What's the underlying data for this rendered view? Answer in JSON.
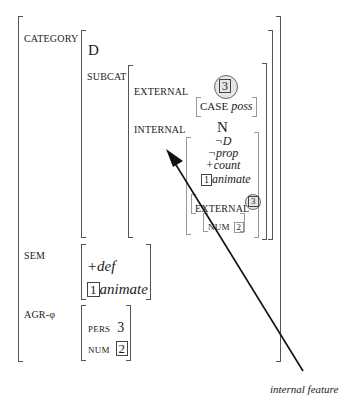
{
  "avm": {
    "category": {
      "label": "CATEGORY",
      "value": "D",
      "subcat": {
        "label": "SUBCAT",
        "external": {
          "label": "EXTERNAL",
          "tag": "3",
          "case_label": "CASE",
          "case_value": "poss"
        },
        "internal": {
          "label": "INTERNAL",
          "head": "N",
          "features": [
            "¬D",
            "¬prop",
            "+count"
          ],
          "animate_tag": "1",
          "animate": "animate",
          "external_label": "EXTERNAL",
          "external_tag": "3",
          "num_label": "NUM",
          "num_tag": "2"
        }
      }
    },
    "sem": {
      "label": "SEM",
      "def": "+def",
      "animate_tag": "1",
      "animate": "animate"
    },
    "agr": {
      "label": "AGR-φ",
      "pers_label": "PERS",
      "pers_value": "3",
      "num_label": "NUM",
      "num_tag": "2"
    }
  },
  "annotation": {
    "label": "internal feature"
  }
}
